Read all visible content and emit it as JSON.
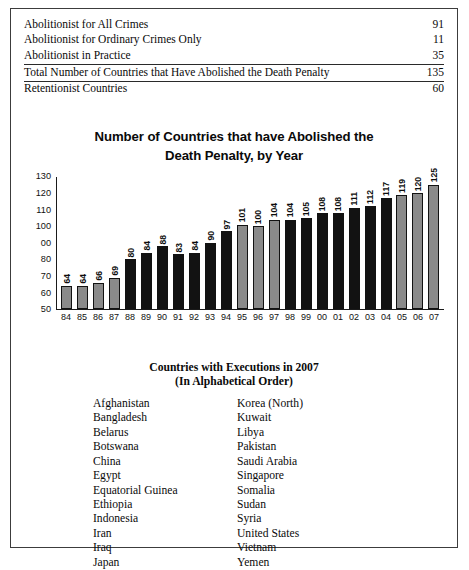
{
  "summary": {
    "rows": [
      {
        "label": "Abolitionist for All Crimes",
        "value": "91",
        "rule": false
      },
      {
        "label": "Abolitionist for Ordinary Crimes Only",
        "value": "11",
        "rule": false
      },
      {
        "label": "Abolitionist in Practice",
        "value": "35",
        "rule": true
      },
      {
        "label": "Total Number of Countries that Have Abolished the Death Penalty",
        "value": "135",
        "rule": true
      },
      {
        "label": "Retentionist Countries",
        "value": "60",
        "rule": false
      }
    ]
  },
  "chart_data": {
    "type": "bar",
    "title": "Number of Countries that have Abolished the Death Penalty, by Year",
    "title_line1": "Number of Countries that have Abolished the",
    "title_line2": "Death Penalty, by Year",
    "xlabel": "",
    "ylabel": "",
    "ylim": [
      50,
      130
    ],
    "yticks": [
      "130",
      "120",
      "110",
      "100",
      "00",
      "80",
      "70",
      "60",
      "50"
    ],
    "ytick_values": [
      130,
      120,
      110,
      100,
      90,
      80,
      70,
      60,
      50
    ],
    "grid": false,
    "legend": "none",
    "categories": [
      "84",
      "85",
      "86",
      "87",
      "88",
      "89",
      "90",
      "91",
      "92",
      "93",
      "94",
      "95",
      "96",
      "97",
      "98",
      "99",
      "00",
      "01",
      "02",
      "03",
      "04",
      "05",
      "06",
      "07"
    ],
    "values": [
      64,
      64,
      66,
      69,
      80,
      84,
      88,
      83,
      84,
      90,
      97,
      101,
      100,
      104,
      104,
      105,
      108,
      108,
      111,
      112,
      117,
      119,
      120,
      125
    ],
    "bar_colors": [
      "gray",
      "gray",
      "gray",
      "gray",
      "black",
      "black",
      "black",
      "black",
      "black",
      "black",
      "black",
      "gray",
      "gray",
      "gray",
      "black",
      "black",
      "black",
      "black",
      "black",
      "black",
      "black",
      "gray",
      "gray",
      "gray"
    ],
    "palette": {
      "gray": "#8a8a8a",
      "black": "#121212",
      "outline": "#121212",
      "axis": "#1a1a1a"
    }
  },
  "countries": {
    "heading_line1": "Countries with Executions in 2007",
    "heading_line2": "(In Alphabetical Order)",
    "left": [
      "Afghanistan",
      "Bangladesh",
      "Belarus",
      "Botswana",
      "China",
      "Egypt",
      "Equatorial Guinea",
      "Ethiopia",
      "Indonesia",
      "Iran",
      "Iraq",
      "Japan"
    ],
    "right": [
      "Korea (North)",
      "Kuwait",
      "Libya",
      "Pakistan",
      "Saudi Arabia",
      "Singapore",
      "Somalia",
      "Sudan",
      "Syria",
      "United States",
      "Vietnam",
      "Yemen"
    ]
  }
}
